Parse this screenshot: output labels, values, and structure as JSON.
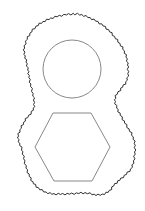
{
  "canvas": {
    "width": 145,
    "height": 211,
    "background": "#ffffff"
  },
  "colors": {
    "outline": "#2e2e2e",
    "shape_stroke": "#7a7a7a"
  },
  "outline": {
    "description": "wavy closed blob outline enclosing both shapes",
    "stroke_width": 1,
    "wave_amplitude": 0.9,
    "wave_step": 2.2,
    "points": [
      [
        75,
        14
      ],
      [
        90,
        18
      ],
      [
        105,
        27
      ],
      [
        117,
        40
      ],
      [
        125,
        53
      ],
      [
        128,
        67
      ],
      [
        127,
        80
      ],
      [
        120,
        90
      ],
      [
        115,
        98
      ],
      [
        117,
        108
      ],
      [
        125,
        123
      ],
      [
        133,
        137
      ],
      [
        135,
        150
      ],
      [
        132,
        167
      ],
      [
        123,
        177
      ],
      [
        115,
        184
      ],
      [
        108,
        192
      ],
      [
        98,
        195
      ],
      [
        85,
        193
      ],
      [
        65,
        194
      ],
      [
        48,
        193
      ],
      [
        35,
        185
      ],
      [
        27,
        170
      ],
      [
        22,
        150
      ],
      [
        18,
        138
      ],
      [
        21,
        128
      ],
      [
        26,
        119
      ],
      [
        33,
        110
      ],
      [
        34,
        100
      ],
      [
        30,
        82
      ],
      [
        28,
        70
      ],
      [
        26,
        60
      ],
      [
        24,
        50
      ],
      [
        28,
        37
      ],
      [
        38,
        25
      ],
      [
        55,
        17
      ]
    ]
  },
  "circle": {
    "cx": 72,
    "cy": 69,
    "r": 29,
    "stroke_width": 0.9
  },
  "hexagon": {
    "stroke_width": 0.9,
    "points": [
      [
        53,
        113
      ],
      [
        91,
        113
      ],
      [
        110,
        147
      ],
      [
        92,
        181
      ],
      [
        54,
        181
      ],
      [
        35,
        147
      ]
    ]
  }
}
